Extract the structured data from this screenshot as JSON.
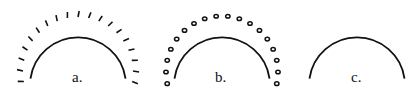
{
  "figure": {
    "panels": [
      {
        "label": "a.",
        "style": "arc-with-radial-dashes",
        "center": [
          78,
          72
        ],
        "radius": 48
      },
      {
        "label": "b.",
        "style": "arc-with-dots",
        "center": [
          222,
          72
        ],
        "radius": 48
      },
      {
        "label": "c.",
        "style": "plain-arc",
        "center": [
          357,
          72
        ],
        "radius": 48
      }
    ],
    "stroke_color": "#111111"
  }
}
